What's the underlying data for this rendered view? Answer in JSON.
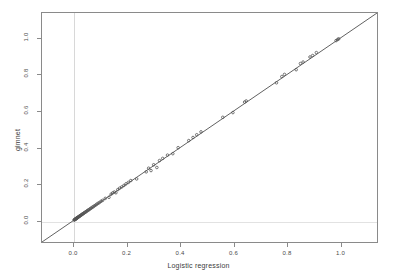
{
  "chart_data": {
    "type": "scatter",
    "title": "",
    "xlabel": "Logistic regression",
    "ylabel": "glmnet",
    "xlim": [
      -0.12,
      1.14
    ],
    "ylim": [
      -0.12,
      1.14
    ],
    "xticks": [
      "0.0",
      "0.2",
      "0.4",
      "0.6",
      "0.8",
      "1.0"
    ],
    "xtick_values": [
      0.0,
      0.2,
      0.4,
      0.6,
      0.8,
      1.0
    ],
    "yticks": [
      "0.0",
      "0.2",
      "0.4",
      "0.6",
      "0.8",
      "1.0"
    ],
    "ytick_values": [
      0.0,
      0.2,
      0.4,
      0.6,
      0.8,
      1.0
    ],
    "grid": true,
    "gridlines": {
      "vertical_at": [
        0.0
      ],
      "horizontal_at": [
        0.0
      ]
    },
    "legend": "none",
    "reference_line": {
      "type": "identity",
      "slope": 1,
      "intercept": 0,
      "color": "#4d4d4d",
      "description": "y = x diagonal"
    },
    "point_style": {
      "marker": "circle",
      "color": "#555555",
      "radius": 1.3
    },
    "x": [
      0.001,
      0.002,
      0.003,
      0.004,
      0.005,
      0.006,
      0.007,
      0.008,
      0.009,
      0.01,
      0.011,
      0.012,
      0.013,
      0.015,
      0.016,
      0.018,
      0.02,
      0.021,
      0.023,
      0.025,
      0.027,
      0.029,
      0.031,
      0.033,
      0.035,
      0.038,
      0.04,
      0.043,
      0.046,
      0.049,
      0.052,
      0.055,
      0.058,
      0.062,
      0.065,
      0.069,
      0.073,
      0.077,
      0.082,
      0.086,
      0.091,
      0.096,
      0.102,
      0.108,
      0.118,
      0.132,
      0.14,
      0.146,
      0.152,
      0.158,
      0.165,
      0.172,
      0.18,
      0.188,
      0.196,
      0.205,
      0.214,
      0.236,
      0.272,
      0.281,
      0.29,
      0.3,
      0.312,
      0.322,
      0.334,
      0.352,
      0.372,
      0.392,
      0.432,
      0.448,
      0.462,
      0.478,
      0.56,
      0.598,
      0.642,
      0.648,
      0.762,
      0.782,
      0.792,
      0.836,
      0.852,
      0.862,
      0.888,
      0.898,
      0.912,
      0.986,
      0.992,
      0.996
    ],
    "y": [
      0.001,
      0.002,
      0.003,
      0.004,
      0.005,
      0.006,
      0.008,
      0.008,
      0.01,
      0.01,
      0.012,
      0.012,
      0.014,
      0.016,
      0.016,
      0.019,
      0.021,
      0.022,
      0.024,
      0.026,
      0.028,
      0.03,
      0.032,
      0.035,
      0.036,
      0.039,
      0.042,
      0.044,
      0.047,
      0.051,
      0.053,
      0.057,
      0.059,
      0.064,
      0.066,
      0.071,
      0.074,
      0.079,
      0.083,
      0.088,
      0.093,
      0.097,
      0.104,
      0.109,
      0.12,
      0.126,
      0.143,
      0.15,
      0.155,
      0.151,
      0.168,
      0.176,
      0.183,
      0.191,
      0.2,
      0.208,
      0.218,
      0.227,
      0.266,
      0.286,
      0.273,
      0.305,
      0.29,
      0.328,
      0.34,
      0.358,
      0.366,
      0.399,
      0.438,
      0.455,
      0.47,
      0.486,
      0.566,
      0.592,
      0.65,
      0.656,
      0.756,
      0.79,
      0.802,
      0.828,
      0.862,
      0.87,
      0.898,
      0.906,
      0.922,
      0.988,
      0.994,
      0.998
    ]
  }
}
